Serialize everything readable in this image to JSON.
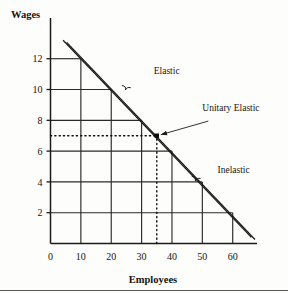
{
  "chart_data": {
    "type": "line",
    "title": "",
    "xlabel": "Employees",
    "ylabel": "Wages",
    "xlim": [
      0,
      68
    ],
    "ylim": [
      0,
      13.8
    ],
    "xticks": [
      0,
      10,
      20,
      30,
      40,
      50,
      60
    ],
    "xtick_labels": [
      "0",
      "10",
      "20",
      "30",
      "40",
      "50",
      "60"
    ],
    "yticks": [
      2,
      4,
      6,
      8,
      10,
      12
    ],
    "ytick_labels": [
      "2",
      "4",
      "6",
      "8",
      "10",
      "12"
    ],
    "grid": "staircase rectangles under the demand curve",
    "series": [
      {
        "name": "Labor demand curve",
        "style": "double-line",
        "x": [
          5,
          67
        ],
        "y": [
          13.2,
          0.4
        ]
      }
    ],
    "annotations": [
      {
        "label": "Elastic",
        "x": 34,
        "y": 11.0,
        "marker": "brace",
        "brace_x": 25,
        "brace_y": 10.0
      },
      {
        "label": "Unitary Elastic",
        "x": 50,
        "y": 8.6,
        "marker": "arrow",
        "points_to_x": 35,
        "points_to_y": 7.0
      },
      {
        "label": "Inelastic",
        "x": 55,
        "y": 4.6,
        "marker": "brace",
        "brace_x": 48,
        "brace_y": 4.1
      }
    ],
    "reference_lines": [
      {
        "orientation": "horizontal",
        "value": 7,
        "style": "dotted",
        "from_x": 0,
        "to_x": 35
      },
      {
        "orientation": "vertical",
        "value": 35,
        "style": "dotted",
        "from_y": 0,
        "to_y": 7
      }
    ],
    "midpoint": {
      "x": 35,
      "y": 7,
      "label": "Unitary Elastic"
    },
    "grid_steps": [
      {
        "x": 10,
        "y": 12
      },
      {
        "x": 20,
        "y": 10
      },
      {
        "x": 30,
        "y": 8
      },
      {
        "x": 40,
        "y": 6
      },
      {
        "x": 50,
        "y": 4
      },
      {
        "x": 60,
        "y": 2
      }
    ]
  },
  "axes": {
    "y_title": "Wages",
    "x_title": "Employees"
  }
}
